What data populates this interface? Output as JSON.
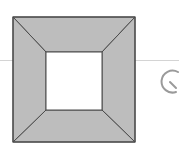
{
  "diagram": {
    "shape": "square-frame-with-beveled-corners",
    "outer_square": {
      "x": 13,
      "y": 17,
      "w": 122,
      "h": 125
    },
    "inner_square": {
      "x": 46,
      "y": 52,
      "w": 56,
      "h": 58
    },
    "fill_color": "#bdbdbd",
    "stroke_color": "#4a4a4a",
    "inner_fill": "#ffffff"
  },
  "controls": {
    "rotate_icon": "rotate-icon"
  }
}
